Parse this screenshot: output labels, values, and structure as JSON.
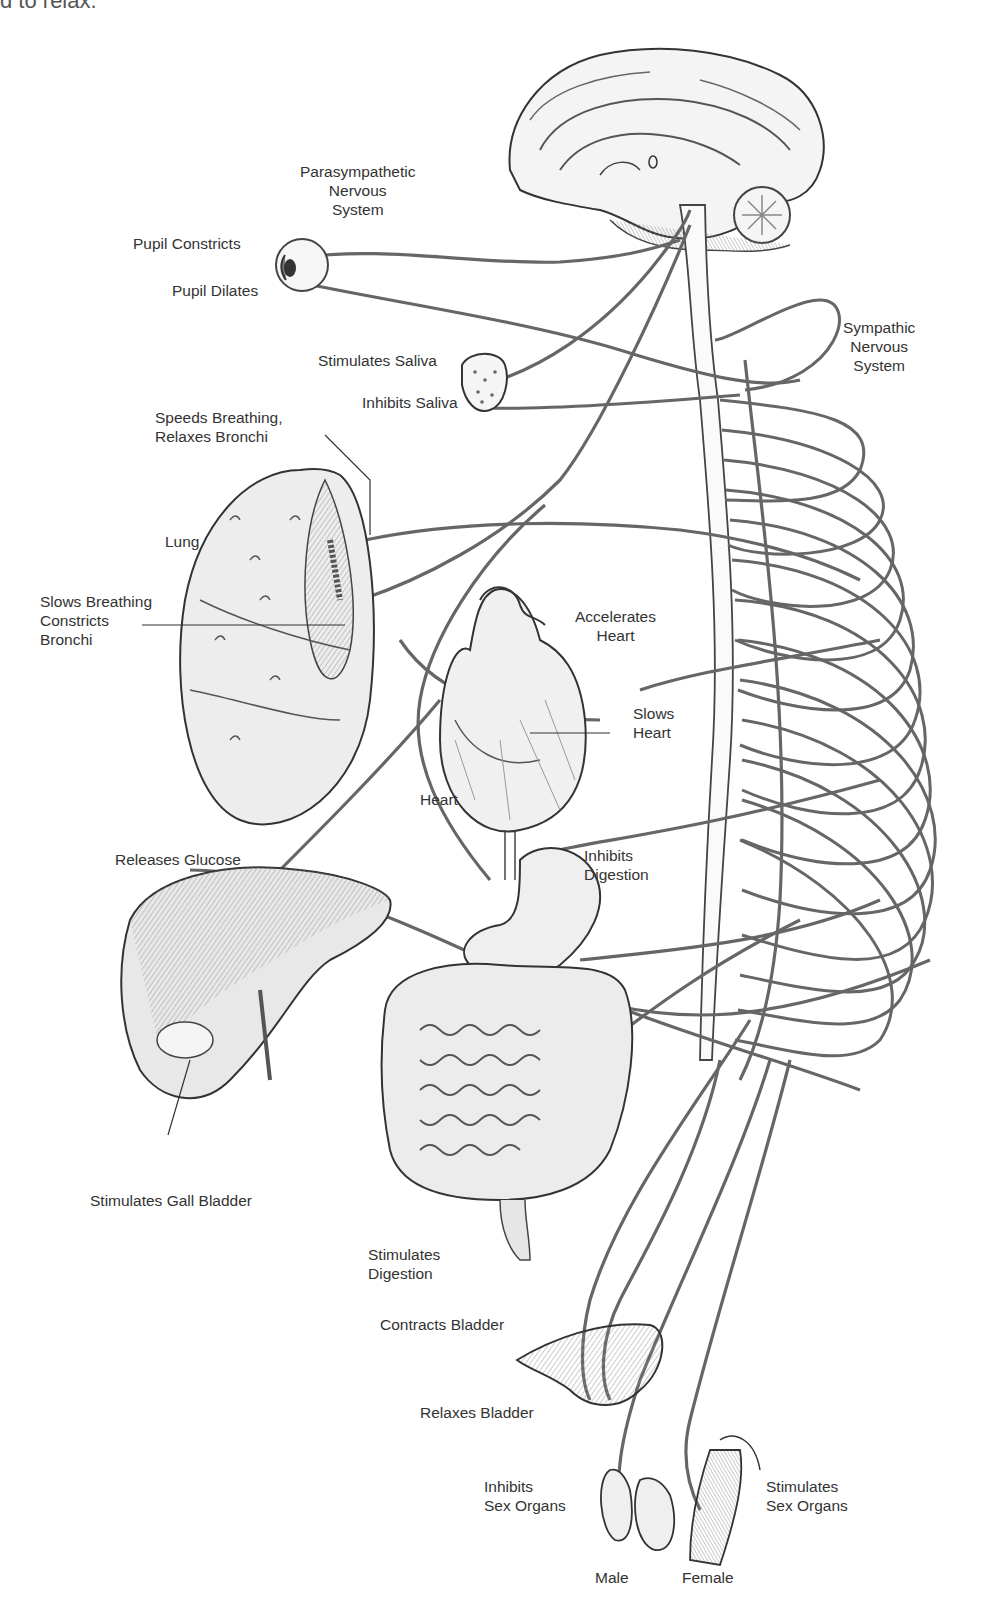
{
  "caption_fragment": "d to relax.",
  "diagram": {
    "systems": {
      "parasympathetic": [
        "Parasympathetic",
        "Nervous",
        "System"
      ],
      "sympathetic": [
        "Sympathic",
        "Nervous",
        "System"
      ]
    },
    "labels": {
      "pupil_constricts": "Pupil Constricts",
      "pupil_dilates": "Pupil Dilates",
      "stimulates_saliva": "Stimulates Saliva",
      "inhibits_saliva": "Inhibits Saliva",
      "speeds_breathing": [
        "Speeds Breathing,",
        "Relaxes Bronchi"
      ],
      "lung": "Lung",
      "slows_breathing": [
        "Slows Breathing",
        "Constricts",
        "Bronchi"
      ],
      "accelerates_heart": [
        "Accelerates",
        "Heart"
      ],
      "slows_heart": [
        "Slows",
        "Heart"
      ],
      "heart": "Heart",
      "releases_glucose": "Releases Glucose",
      "inhibits_digestion": [
        "Inhibits",
        "Digestion"
      ],
      "stimulates_gall_bladder": "Stimulates Gall Bladder",
      "stimulates_digestion": [
        "Stimulates",
        "Digestion"
      ],
      "contracts_bladder": "Contracts Bladder",
      "relaxes_bladder": "Relaxes Bladder",
      "inhibits_sex_organs": [
        "Inhibits",
        "Sex Organs"
      ],
      "stimulates_sex_organs": [
        "Stimulates",
        "Sex Organs"
      ],
      "male": "Male",
      "female": "Female"
    },
    "colors": {
      "ink": "#2b2b2b",
      "nerve": "#6a6a6a",
      "shade": "#c8c8c8",
      "background": "#ffffff"
    }
  }
}
